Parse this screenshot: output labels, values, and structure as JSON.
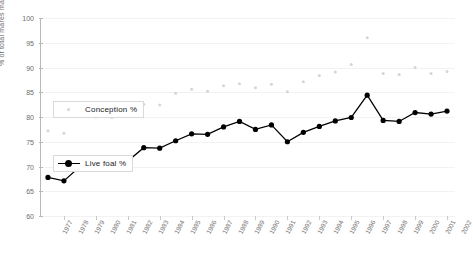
{
  "chart_data": {
    "type": "line",
    "title": "",
    "xlabel": "",
    "ylabel": "% of total mares mated",
    "ylim": [
      60,
      100
    ],
    "ytick_values": [
      100,
      95,
      90,
      85,
      80,
      75,
      70,
      65,
      60
    ],
    "ytick_labels": [
      "100",
      "95",
      "90",
      "85",
      "80",
      "75",
      "70",
      "65",
      "60"
    ],
    "grid": true,
    "legend_position": "inside-left",
    "categories": [
      "1977",
      "1978",
      "1979",
      "1980",
      "1981",
      "1982",
      "1983",
      "1984",
      "1985",
      "1986",
      "1987",
      "1988",
      "1989",
      "1990",
      "1991",
      "1992",
      "1993",
      "1994",
      "1995",
      "1996",
      "1997",
      "1998",
      "1999",
      "2000",
      "2001",
      "2002"
    ],
    "series": [
      {
        "name": "Conception %",
        "marker": "faint-dot",
        "color": "#d5d5d5",
        "values": [
          77.2,
          76.7,
          80.2,
          80.0,
          79.9,
          80.3,
          82.6,
          82.4,
          84.8,
          85.6,
          85.2,
          86.3,
          86.7,
          85.9,
          86.6,
          85.1,
          87.1,
          88.4,
          89.1,
          90.6,
          96.0,
          88.8,
          88.6,
          90.0,
          88.8,
          89.2
        ]
      },
      {
        "name": "Live foal %",
        "marker": "filled-circle",
        "color": "#000000",
        "values": [
          67.8,
          67.1,
          70.0,
          70.6,
          71.1,
          71.1,
          73.8,
          73.7,
          75.2,
          76.6,
          76.5,
          78.0,
          79.1,
          77.5,
          78.4,
          75.0,
          76.9,
          78.1,
          79.2,
          79.9,
          84.4,
          79.3,
          79.1,
          80.9,
          80.6,
          81.2
        ]
      }
    ]
  },
  "legend": {
    "conception_label": "Conception %",
    "livefoal_label": "Live foal %"
  }
}
